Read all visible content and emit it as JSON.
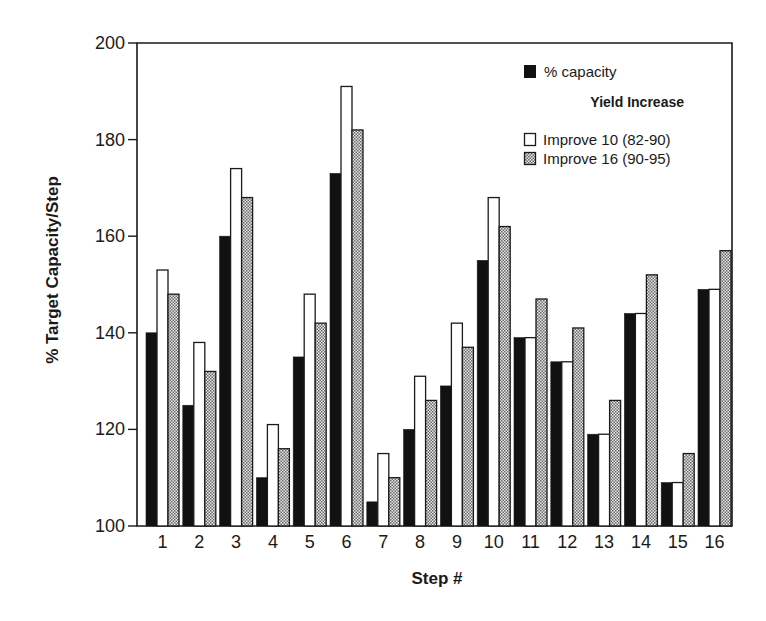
{
  "chart_data": {
    "type": "bar",
    "title": "",
    "xlabel": "Step #",
    "ylabel": "% Target Capacity/Step",
    "ylim": [
      100,
      200
    ],
    "yticks": [
      100,
      120,
      140,
      160,
      180,
      200
    ],
    "grid": false,
    "legend_position": "top-right",
    "legend_title": "Yield Increase",
    "categories": [
      "1",
      "2",
      "3",
      "4",
      "5",
      "6",
      "7",
      "8",
      "9",
      "10",
      "11",
      "12",
      "13",
      "14",
      "15",
      "16"
    ],
    "series": [
      {
        "name": "% capacity",
        "fill": "solid-black",
        "values": [
          140,
          125,
          160,
          110,
          135,
          173,
          105,
          120,
          129,
          155,
          139,
          134,
          119,
          144,
          109,
          149
        ]
      },
      {
        "name": "Improve 10 (82-90)",
        "fill": "white",
        "values": [
          153,
          138,
          174,
          121,
          148,
          191,
          115,
          131,
          142,
          168,
          139,
          134,
          119,
          144,
          109,
          149
        ]
      },
      {
        "name": "Improve 16 (90-95)",
        "fill": "gray-dotted",
        "values": [
          148,
          132,
          168,
          116,
          142,
          182,
          110,
          126,
          137,
          162,
          147,
          141,
          126,
          152,
          115,
          157
        ]
      }
    ]
  },
  "legend": {
    "item0": "% capacity",
    "title": "Yield Increase",
    "item1": "Improve 10 (82-90)",
    "item2": "Improve 16 (90-95)"
  },
  "axes": {
    "xlabel": "Step #",
    "ylabel": "% Target Capacity/Step"
  },
  "colors": {
    "black_bar": "#111111",
    "white_bar": "#ffffff",
    "dotted_bar_dark": "#6a6a6a",
    "dotted_bar_light": "#e8e8e8",
    "axis": "#1a1a1a"
  }
}
